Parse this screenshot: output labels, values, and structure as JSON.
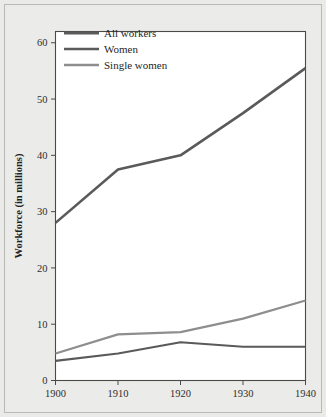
{
  "figure": {
    "background_color": "#eaeae8",
    "plot_background_color": "#ffffff",
    "frame_color": "#4a4a4a"
  },
  "chart_data": {
    "type": "line",
    "title": "",
    "xlabel": "",
    "ylabel": "Workforce (in millions)",
    "x": [
      1900,
      1910,
      1920,
      1930,
      1940
    ],
    "categories": [
      "1900",
      "1910",
      "1920",
      "1930",
      "1940"
    ],
    "xlim": [
      1900,
      1940
    ],
    "ylim": [
      0,
      62
    ],
    "yticks": [
      0,
      10,
      20,
      30,
      40,
      50,
      60
    ],
    "ytick_labels": [
      "0",
      "10",
      "20",
      "30",
      "40",
      "50",
      "60"
    ],
    "xticks": [
      1900,
      1910,
      1920,
      1930,
      1940
    ],
    "xtick_labels": [
      "1900",
      "1910",
      "1920",
      "1930",
      "1940"
    ],
    "grid": false,
    "legend_position": "top-left",
    "series": [
      {
        "name": "All workers",
        "color": "#5a5a5a",
        "line_width": 2.6,
        "values": [
          28.0,
          37.5,
          40.0,
          47.5,
          55.5
        ]
      },
      {
        "name": "Women",
        "color": "#5a5a5a",
        "line_width": 2.2,
        "values": [
          3.5,
          4.8,
          6.8,
          6.0,
          6.0
        ]
      },
      {
        "name": "Single women",
        "color": "#8e8e8e",
        "line_width": 2.2,
        "values": [
          4.8,
          8.2,
          8.6,
          11.0,
          14.2
        ]
      }
    ]
  },
  "legend": {
    "entries": [
      {
        "label": "All workers",
        "color": "#5a5a5a",
        "line_width": 3.0
      },
      {
        "label": "Women",
        "color": "#5a5a5a",
        "line_width": 2.6
      },
      {
        "label": "Single women",
        "color": "#8e8e8e",
        "line_width": 2.6
      }
    ]
  }
}
